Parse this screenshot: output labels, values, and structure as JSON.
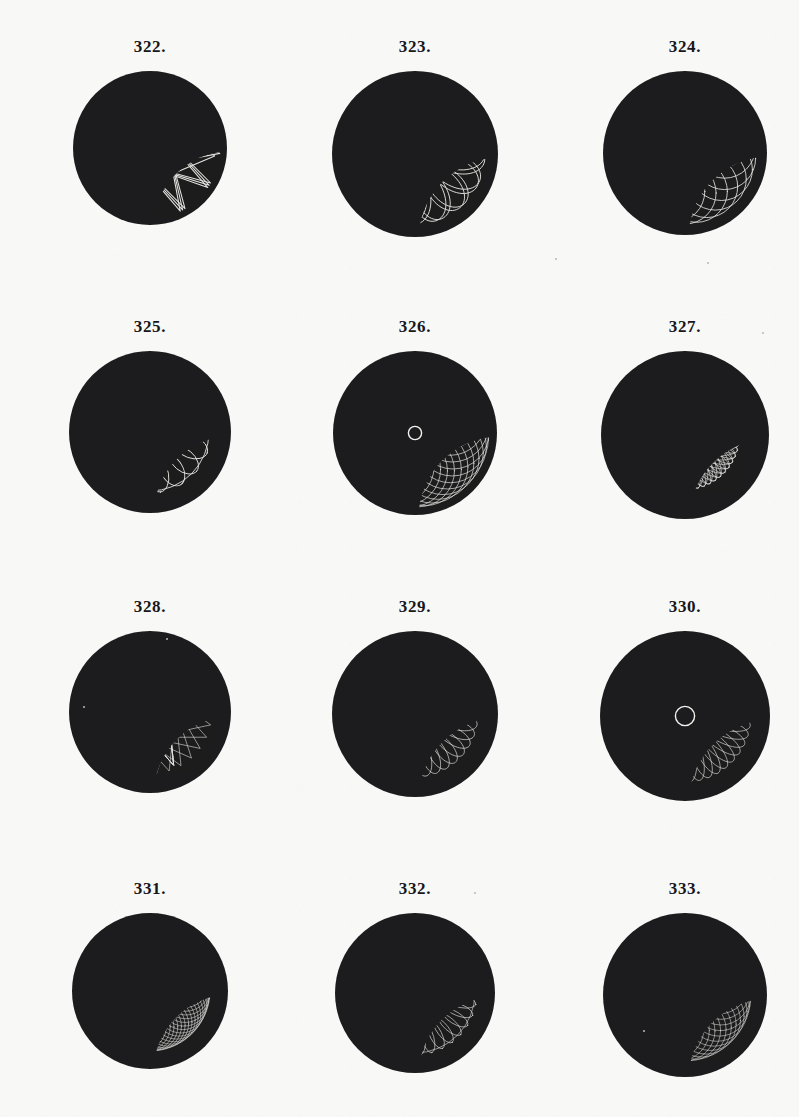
{
  "plate": {
    "background_color": "#f8f8f6",
    "disc_color": "#1c1c1e",
    "curve_color": "#f2f2ee",
    "caption_color": "#17171a",
    "columns": 3,
    "rows": 4,
    "figure_count": 12
  },
  "figures": [
    {
      "caption": "322.",
      "number": 322,
      "disc_radius": 77,
      "inner_void_radius": 36,
      "pattern": "star-polygon",
      "description": "twelve-pointed interlaced star polygon with dark circular centre",
      "points": 12,
      "step": 5,
      "outer_radius": 70,
      "inner_radius": 0,
      "line_width": 1.05,
      "rotation": 0,
      "passes": 3,
      "pass_offset": 2.2
    },
    {
      "caption": "323.",
      "number": 323,
      "disc_radius": 83,
      "inner_void_radius": 11,
      "pattern": "petal-rosette",
      "description": "sixteen long looping petals radiating from a small dark centre",
      "petals": 16,
      "petal_length": 70,
      "petal_width": 19,
      "inner_start": 9,
      "line_width": 0.95,
      "rotation": 0,
      "passes": 2,
      "pass_offset": 5
    },
    {
      "caption": "324.",
      "number": 324,
      "disc_radius": 82,
      "inner_void_radius": 26,
      "pattern": "epitrochoid-mesh",
      "description": "broad overlapping circle mesh forming an open ring, dark elliptical centre",
      "loops": 22,
      "big_radius": 40,
      "small_radius": 31,
      "line_width": 0.85,
      "rotation": 8,
      "passes": 1,
      "pass_offset": 0
    },
    {
      "caption": "325.",
      "number": 325,
      "disc_radius": 81,
      "inner_void_radius": 30,
      "pattern": "inward-loop-ring",
      "description": "ring of inward-pointing ovate loops inside an outer circle",
      "loops": 18,
      "loop_length": 34,
      "loop_width": 22,
      "ring_radius": 44,
      "line_width": 0.9,
      "rotation": 0,
      "passes": 1,
      "pass_offset": 0
    },
    {
      "caption": "326.",
      "number": 326,
      "disc_radius": 82,
      "inner_void_radius": 5,
      "pattern": "cardioid-mesh",
      "description": "dense cardioid spirograph filling the disc with a tiny white-ringed centre dot",
      "loops": 34,
      "big_radius": 38,
      "small_radius": 36,
      "line_width": 0.7,
      "rotation": 0,
      "passes": 1,
      "pass_offset": 0
    },
    {
      "caption": "327.",
      "number": 327,
      "disc_radius": 84,
      "inner_void_radius": 38,
      "pattern": "dense-annulus",
      "description": "tight annulus of many narrow overlapping ellipses, large black centre",
      "ellipses": 54,
      "ellipse_rx": 54,
      "ellipse_ry": 11,
      "ring_offset": 9,
      "line_width": 0.6,
      "rotation": 0,
      "passes": 1,
      "pass_offset": 0
    },
    {
      "caption": "328.",
      "number": 328,
      "disc_radius": 81,
      "inner_void_radius": 30,
      "pattern": "spiked-star",
      "description": "thirty sharp spikes radiating outward around a dark centre",
      "points": 30,
      "step": 11,
      "outer_radius": 62,
      "line_width": 0.6,
      "rotation": 0,
      "passes": 1,
      "pass_offset": 0
    },
    {
      "caption": "329.",
      "number": 329,
      "disc_radius": 83,
      "inner_void_radius": 20,
      "pattern": "petal-rosette",
      "description": "thirty-six narrow petals forming a daisy with dark round centre",
      "petals": 36,
      "petal_length": 63,
      "petal_width": 10,
      "inner_start": 18,
      "line_width": 0.7,
      "rotation": 0,
      "passes": 1,
      "pass_offset": 0
    },
    {
      "caption": "330.",
      "number": 330,
      "disc_radius": 85,
      "inner_void_radius": 8,
      "pattern": "petal-rosette",
      "description": "forty-two petals converging on a tiny dark centre dot",
      "petals": 42,
      "petal_length": 66,
      "petal_width": 10,
      "inner_start": 6,
      "line_width": 0.65,
      "rotation": 0,
      "passes": 1,
      "pass_offset": 0
    },
    {
      "caption": "331.",
      "number": 331,
      "disc_radius": 78,
      "inner_void_radius": 34,
      "pattern": "lattice-ring",
      "description": "crosshatched lattice ring of square cells, offset dark interior",
      "loops": 30,
      "big_radius": 36,
      "small_radius": 24,
      "line_width": 0.55,
      "rotation": 0,
      "passes": 2,
      "pass_offset": 6
    },
    {
      "caption": "332.",
      "number": 332,
      "disc_radius": 80,
      "inner_void_radius": 30,
      "pattern": "inward-loop-ring",
      "description": "ring of many small inward loops, dark centre",
      "loops": 34,
      "loop_length": 30,
      "loop_width": 12,
      "ring_radius": 47,
      "line_width": 0.6,
      "rotation": 0,
      "passes": 1,
      "pass_offset": 0
    },
    {
      "caption": "333.",
      "number": 333,
      "disc_radius": 82,
      "inner_void_radius": 20,
      "pattern": "epitrochoid-mesh",
      "description": "fine mesh of interwoven curves with round black centre",
      "loops": 40,
      "big_radius": 36,
      "small_radius": 30,
      "line_width": 0.55,
      "rotation": 0,
      "passes": 1,
      "pass_offset": 0
    }
  ],
  "layout": {
    "column_centers_x": [
      150,
      415,
      685
    ],
    "row_caption_y": [
      38,
      318,
      598,
      880
    ],
    "cell_width": 200
  }
}
